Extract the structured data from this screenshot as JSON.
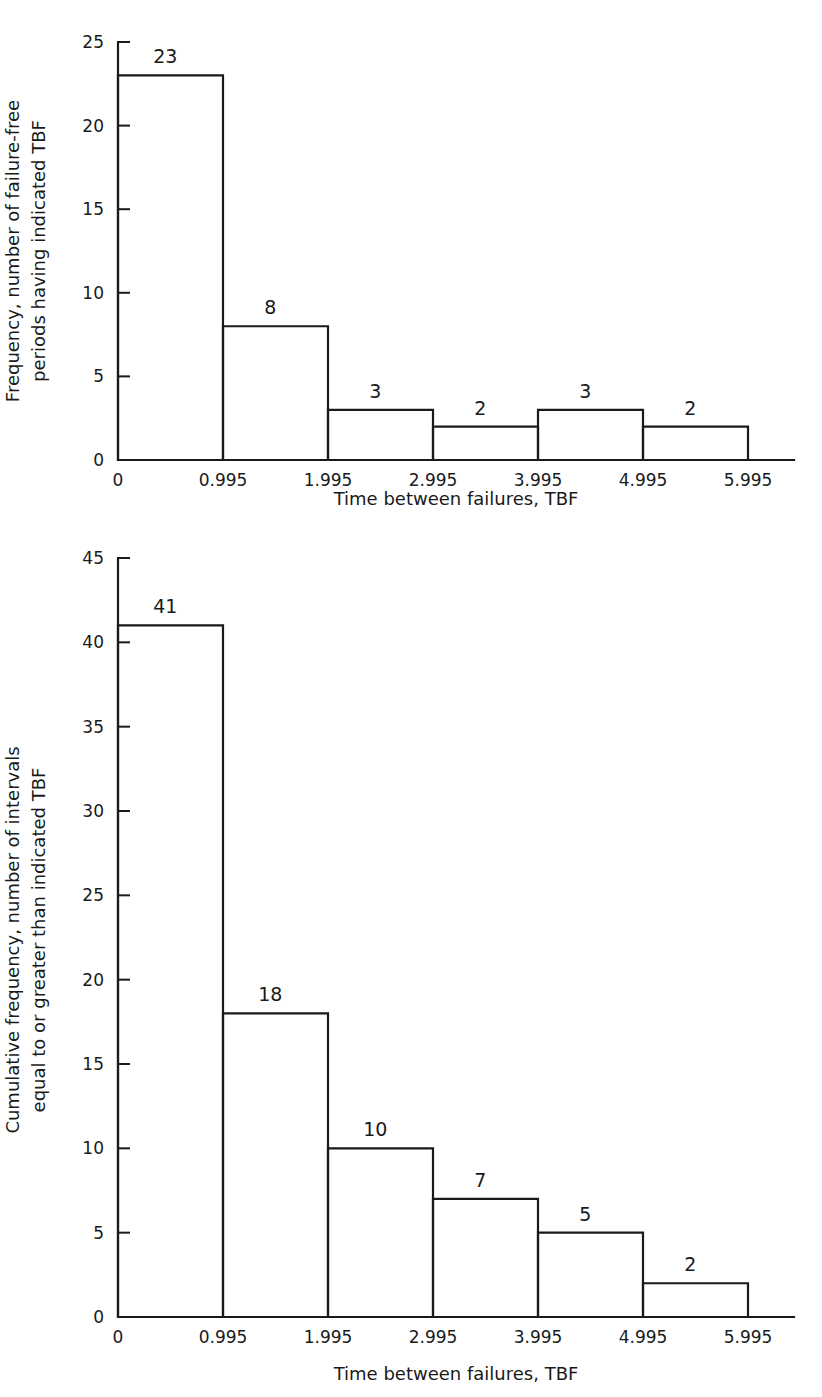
{
  "chart_data": [
    {
      "id": "top-histogram",
      "type": "bar",
      "title": "",
      "xlabel": "Time between failures, TBF",
      "ylabel": "Frequency, number of failure-free periods having indicated TBF",
      "ylabel_lines": [
        "Frequency, number of failure-free",
        "periods having indicated TBF"
      ],
      "categories": [
        "0",
        "0.995",
        "1.995",
        "2.995",
        "3.995",
        "4.995",
        "5.995"
      ],
      "bin_edges": [
        0,
        0.995,
        1.995,
        2.995,
        3.995,
        4.995,
        5.995
      ],
      "values": [
        23,
        8,
        3,
        2,
        3,
        2
      ],
      "bar_labels": [
        "23",
        "8",
        "3",
        "2",
        "3",
        "2"
      ],
      "ylim": [
        0,
        25
      ],
      "yticks": [
        0,
        5,
        10,
        15,
        20,
        25
      ],
      "ytick_labels": [
        "0",
        "5",
        "10",
        "15",
        "20",
        "25"
      ],
      "grid": false,
      "legend": "none"
    },
    {
      "id": "bottom-histogram",
      "type": "bar",
      "title": "",
      "xlabel": "Time between failures, TBF",
      "ylabel": "Cumulative frequency, number of intervals equal to or greater than indicated TBF",
      "ylabel_lines": [
        "Cumulative frequency, number of intervals",
        "equal to or greater than indicated TBF"
      ],
      "categories": [
        "0",
        "0.995",
        "1.995",
        "2.995",
        "3.995",
        "4.995",
        "5.995"
      ],
      "bin_edges": [
        0,
        0.995,
        1.995,
        2.995,
        3.995,
        4.995,
        5.995
      ],
      "values": [
        41,
        18,
        10,
        7,
        5,
        2
      ],
      "bar_labels": [
        "41",
        "18",
        "10",
        "7",
        "5",
        "2"
      ],
      "ylim": [
        0,
        45
      ],
      "yticks": [
        0,
        5,
        10,
        15,
        20,
        25,
        30,
        35,
        40,
        45
      ],
      "ytick_labels": [
        "0",
        "5",
        "10",
        "15",
        "20",
        "25",
        "30",
        "35",
        "40",
        "45"
      ],
      "grid": false,
      "legend": "none"
    }
  ],
  "style": {
    "line_color": "#1a1a1a",
    "background": "#ffffff",
    "bar_fill": "none"
  }
}
